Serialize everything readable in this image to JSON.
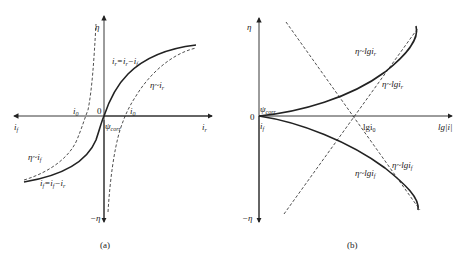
{
  "panel_a": {
    "caption": "(a)",
    "axis": {
      "y_top": "η",
      "y_bottom": "−η",
      "x_left": "i",
      "x_left_sub": "f",
      "x_right": "i",
      "x_right_sub": "r",
      "origin": "0",
      "psi": "ψ",
      "psi_sub": "corr"
    },
    "labels": {
      "i0_left": "i",
      "i0_left_sub": "0",
      "i0_right": "i",
      "i0_right_sub": "0",
      "net_r": "i",
      "net_r_sub": "r",
      "net_r_eq": "=i",
      "net_r_eq_sub": "r",
      "net_r_minus": "−i",
      "net_r_minus_sub": "f",
      "eta_ir": "η~i",
      "eta_ir_sub": "r",
      "eta_if": "η~i",
      "eta_if_sub": "f",
      "net_f": "i",
      "net_f_sub": "f",
      "net_f_eq": "=i",
      "net_f_eq_sub": "f",
      "net_f_minus": "−i",
      "net_f_minus_sub": "r"
    }
  },
  "panel_b": {
    "caption": "(b)",
    "axis": {
      "y_top": "η",
      "y_bottom": "−η",
      "x_right": "lg|i|",
      "origin": "0",
      "psi": "ψ",
      "psi_sub": "corr",
      "if_label": "i",
      "if_sub": "f"
    },
    "labels": {
      "lgi0": "lgi",
      "lgi0_sub": "0",
      "upper_solid": "η~lgi",
      "upper_solid_sub": "r",
      "upper_dash": "η~lgi",
      "upper_dash_sub": "r",
      "lower_solid": "η~lgi",
      "lower_solid_sub": "f",
      "lower_dash": "η~lgi",
      "lower_dash_sub": "f"
    }
  }
}
